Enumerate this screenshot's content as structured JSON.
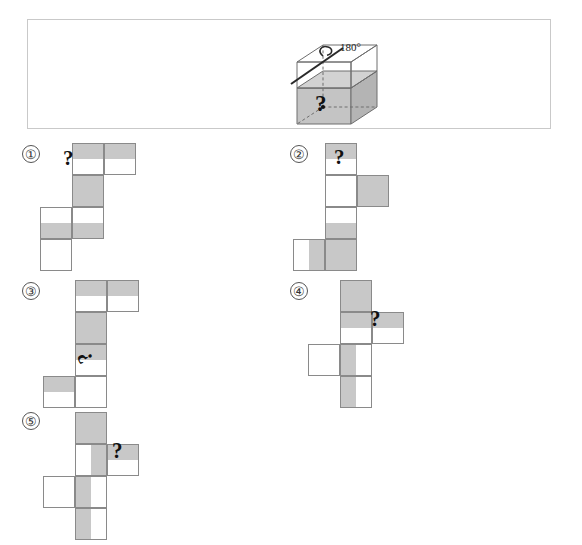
{
  "page": {
    "background": "#ffffff",
    "shade_color": "#c8c8c8",
    "line_color": "#8a8a8a",
    "frame_color": "#c9c9c9"
  },
  "question": {
    "rotation_label": "180°",
    "rotation_icon": "rotation-arrow-icon",
    "cube_icon": "cube-diagram",
    "cube_mark": "?",
    "description": "A cube shaded on its lower half with a question mark on the front face, to be rotated 180 degrees about a diagonal axis."
  },
  "options": [
    {
      "id": "option-1",
      "label": "①",
      "label_x": 22,
      "label_y": 145,
      "origin_x": 40,
      "origin_y": 143,
      "mark": "?",
      "mark_style": "qm-up",
      "mark_x": 63,
      "mark_y": 148,
      "cells": [
        {
          "x": 32,
          "y": 0,
          "w": 32,
          "h": 32,
          "shade": "sh-top"
        },
        {
          "x": 64,
          "y": 0,
          "w": 32,
          "h": 32,
          "shade": "sh-top"
        },
        {
          "x": 32,
          "y": 32,
          "w": 32,
          "h": 32,
          "shade": "sh-full"
        },
        {
          "x": 32,
          "y": 64,
          "w": 32,
          "h": 32,
          "shade": "sh-bot"
        },
        {
          "x": 0,
          "y": 64,
          "w": 32,
          "h": 32,
          "shade": "sh-bot"
        },
        {
          "x": 0,
          "y": 96,
          "w": 32,
          "h": 32,
          "shade": "none"
        }
      ]
    },
    {
      "id": "option-2",
      "label": "②",
      "label_x": 290,
      "label_y": 145,
      "origin_x": 325,
      "origin_y": 143,
      "mark": "?",
      "mark_style": "qm-up",
      "mark_x": 334,
      "mark_y": 147,
      "cells": [
        {
          "x": 0,
          "y": 0,
          "w": 32,
          "h": 32,
          "shade": "sh-top"
        },
        {
          "x": 0,
          "y": 32,
          "w": 32,
          "h": 32,
          "shade": "none"
        },
        {
          "x": 32,
          "y": 32,
          "w": 32,
          "h": 32,
          "shade": "sh-full"
        },
        {
          "x": 0,
          "y": 64,
          "w": 32,
          "h": 32,
          "shade": "sh-bot"
        },
        {
          "x": 0,
          "y": 96,
          "w": 32,
          "h": 32,
          "shade": "sh-full"
        },
        {
          "x": -32,
          "y": 96,
          "w": 32,
          "h": 32,
          "shade": "sh-right"
        }
      ]
    },
    {
      "id": "option-3",
      "label": "③",
      "label_x": 22,
      "label_y": 282,
      "origin_x": 75,
      "origin_y": 280,
      "mark": "?",
      "mark_style": "qm-rot",
      "mark_x": 80,
      "mark_y": 347,
      "cells": [
        {
          "x": 0,
          "y": 0,
          "w": 32,
          "h": 32,
          "shade": "sh-top"
        },
        {
          "x": 32,
          "y": 0,
          "w": 32,
          "h": 32,
          "shade": "sh-top"
        },
        {
          "x": 0,
          "y": 32,
          "w": 32,
          "h": 32,
          "shade": "sh-full"
        },
        {
          "x": 0,
          "y": 64,
          "w": 32,
          "h": 32,
          "shade": "sh-top"
        },
        {
          "x": 0,
          "y": 96,
          "w": 32,
          "h": 32,
          "shade": "none"
        },
        {
          "x": -32,
          "y": 96,
          "w": 32,
          "h": 32,
          "shade": "sh-top"
        }
      ]
    },
    {
      "id": "option-4",
      "label": "④",
      "label_x": 290,
      "label_y": 282,
      "origin_x": 340,
      "origin_y": 280,
      "mark": "¿",
      "mark_style": "qm-inv",
      "mark_x": 370,
      "mark_y": 312,
      "cells": [
        {
          "x": 0,
          "y": 0,
          "w": 32,
          "h": 32,
          "shade": "sh-full"
        },
        {
          "x": 0,
          "y": 32,
          "w": 32,
          "h": 32,
          "shade": "sh-top"
        },
        {
          "x": 32,
          "y": 32,
          "w": 32,
          "h": 32,
          "shade": "sh-top"
        },
        {
          "x": 0,
          "y": 64,
          "w": 32,
          "h": 32,
          "shade": "sh-left"
        },
        {
          "x": -32,
          "y": 64,
          "w": 32,
          "h": 32,
          "shade": "none"
        },
        {
          "x": 0,
          "y": 96,
          "w": 32,
          "h": 32,
          "shade": "sh-left"
        }
      ]
    },
    {
      "id": "option-5",
      "label": "⑤",
      "label_x": 22,
      "label_y": 412,
      "origin_x": 75,
      "origin_y": 412,
      "mark": "¿",
      "mark_style": "qm-inv",
      "mark_x": 112,
      "mark_y": 444,
      "cells": [
        {
          "x": 0,
          "y": 0,
          "w": 32,
          "h": 32,
          "shade": "sh-full"
        },
        {
          "x": 0,
          "y": 32,
          "w": 32,
          "h": 32,
          "shade": "sh-right"
        },
        {
          "x": 32,
          "y": 32,
          "w": 32,
          "h": 32,
          "shade": "sh-top"
        },
        {
          "x": 0,
          "y": 64,
          "w": 32,
          "h": 32,
          "shade": "sh-left"
        },
        {
          "x": -32,
          "y": 64,
          "w": 32,
          "h": 32,
          "shade": "none"
        },
        {
          "x": 0,
          "y": 96,
          "w": 32,
          "h": 32,
          "shade": "sh-left"
        }
      ]
    }
  ]
}
